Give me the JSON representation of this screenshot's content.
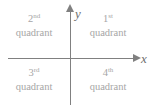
{
  "figure": {
    "axis_color": "#808080",
    "label_color": "#a6a6a6",
    "axis_label_color": "#6e6e6e",
    "background_color": "#ffffff"
  },
  "axes": {
    "x": {
      "label": "x",
      "arrow_direction": "right"
    },
    "y": {
      "label": "y",
      "arrow_direction": "up"
    }
  },
  "quadrants": [
    {
      "id": "first",
      "number": "1",
      "suffix": "st",
      "word": "quadrant",
      "position": "upper-right"
    },
    {
      "id": "second",
      "number": "2",
      "suffix": "nd",
      "word": "quadrant",
      "position": "upper-left"
    },
    {
      "id": "third",
      "number": "3",
      "suffix": "rd",
      "word": "quadrant",
      "position": "lower-left"
    },
    {
      "id": "fourth",
      "number": "4",
      "suffix": "th",
      "word": "quadrant",
      "position": "lower-right"
    }
  ]
}
